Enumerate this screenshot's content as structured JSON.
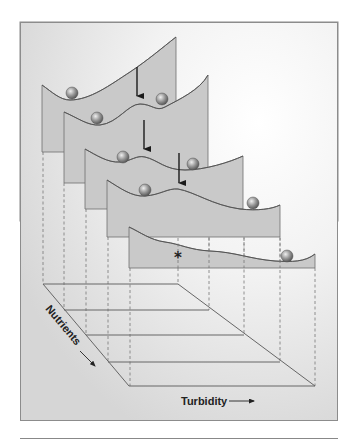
{
  "figure": {
    "type": "stability-landscape-diagram",
    "colors": {
      "frame_bg_light": "#fbfbfb",
      "frame_bg_dark": "#dcdcdc",
      "frame_border": "#8c8c8c",
      "panel_fill": "#c9c9c9",
      "panel_stroke": "#6f6f6f",
      "curve_stroke": "#555555",
      "ball_light": "#e8e8e8",
      "ball_dark": "#5a5a5a",
      "arrow": "#1a1a1a",
      "grid_line": "#666666",
      "dashed_line": "#777777",
      "bottom_rule": "#888888"
    },
    "axes": {
      "x_label": "Turbidity",
      "y_label": "Nutrients"
    },
    "panels": [
      {
        "index": 1,
        "balls": 2,
        "arrow": true,
        "description": "two basins, deep left basin and shallower right basin"
      },
      {
        "index": 2,
        "balls": 2,
        "arrow": true,
        "description": "two basins of similar depth"
      },
      {
        "index": 3,
        "balls": 2,
        "arrow": true,
        "description": "two basins, left one shrinking"
      },
      {
        "index": 4,
        "balls": 2,
        "arrow": false,
        "description": "shallow left basin, deep right basin"
      },
      {
        "index": 5,
        "balls": 1,
        "arrow": false,
        "marker": "*",
        "description": "single basin on the right; star marks former left state"
      }
    ],
    "marker": "*"
  }
}
